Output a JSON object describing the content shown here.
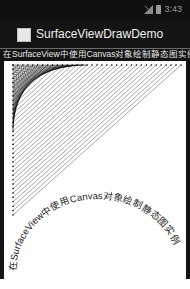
{
  "status_bar": {
    "time": "3:43",
    "icons": [
      "signal-icon",
      "battery-icon"
    ]
  },
  "action_bar": {
    "app_icon": "app-icon",
    "title": "SurfaceViewDrawDemo"
  },
  "subtitle": "在SurfaceView中使用Canvas对象绘制静态图实例",
  "canvas": {
    "arc_text": "在SurfaceView中使用Canvas对象绘制静态图实例",
    "line_color": "#000000",
    "background": "#ffffff",
    "border_color": "#141414"
  }
}
